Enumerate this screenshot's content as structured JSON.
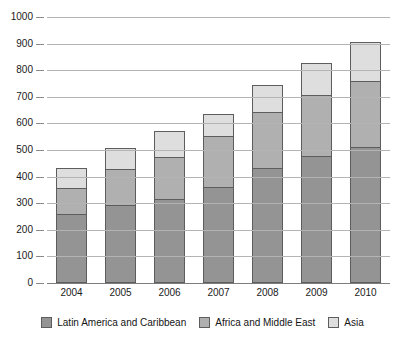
{
  "chart_data": {
    "type": "bar",
    "stacked": true,
    "title": "",
    "subtitle": "",
    "xlabel": "",
    "ylabel": "",
    "categories": [
      "2004",
      "2005",
      "2006",
      "2007",
      "2008",
      "2009",
      "2010"
    ],
    "series": [
      {
        "name": "Latin America and Caribbean",
        "color": "#949494",
        "values": [
          255,
          290,
          313,
          357,
          430,
          472,
          507
        ]
      },
      {
        "name": "Africa and Middle East",
        "color": "#b0b0b0",
        "values": [
          100,
          135,
          157,
          191,
          210,
          231,
          250
        ]
      },
      {
        "name": "Asia",
        "color": "#dedede",
        "values": [
          75,
          80,
          97,
          82,
          102,
          119,
          145
        ]
      }
    ],
    "totals": [
      430,
      505,
      567,
      630,
      742,
      822,
      902
    ],
    "ylim": [
      0,
      1000
    ],
    "yticks": [
      0,
      100,
      200,
      300,
      400,
      500,
      600,
      700,
      800,
      900,
      1000
    ],
    "ytick_labels": [
      "0",
      "100",
      "200",
      "300",
      "400",
      "500",
      "600",
      "700",
      "800",
      "900",
      "1000"
    ],
    "grid": true,
    "legend_position": "bottom"
  },
  "legend": {
    "items": [
      {
        "label": "Latin America and Caribbean",
        "color": "#949494"
      },
      {
        "label": "Africa and Middle East",
        "color": "#b0b0b0"
      },
      {
        "label": "Asia",
        "color": "#dedede"
      }
    ]
  }
}
